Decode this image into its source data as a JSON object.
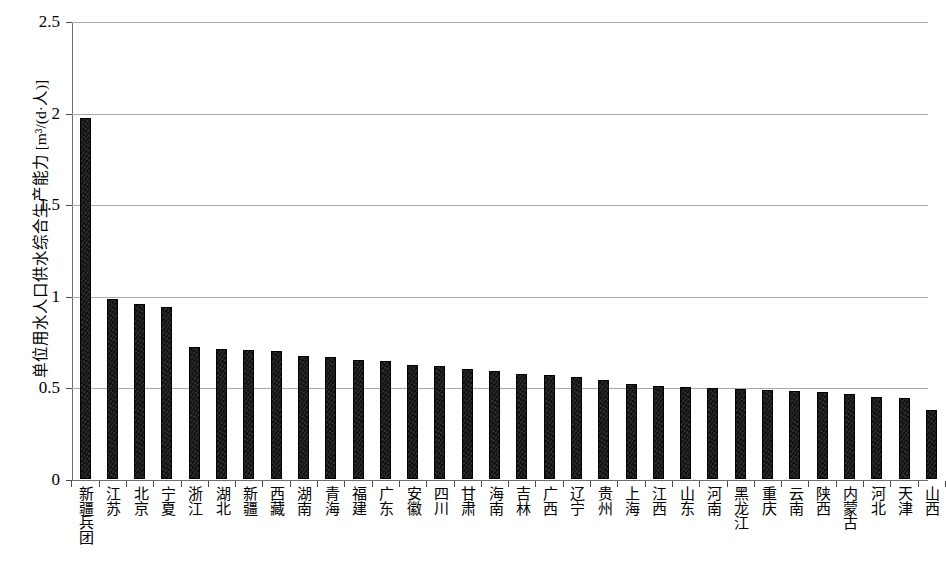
{
  "chart_data": {
    "type": "bar",
    "title": "",
    "xlabel": "",
    "ylabel": "单位用水人口供水综合生产能力 [m³/(d·人)]",
    "ylim": [
      0,
      2.5
    ],
    "ytick_labels": [
      "0",
      "0.5",
      "1",
      "1.5",
      "2",
      "2.5"
    ],
    "ytick_values": [
      0,
      0.5,
      1,
      1.5,
      2,
      2.5
    ],
    "grid": true,
    "legend": null,
    "categories": [
      "新疆兵团",
      "江苏",
      "北京",
      "宁夏",
      "浙江",
      "湖北",
      "新疆",
      "西藏",
      "湖南",
      "青海",
      "福建",
      "广东",
      "安徽",
      "四川",
      "甘肃",
      "海南",
      "吉林",
      "广西",
      "辽宁",
      "贵州",
      "上海",
      "江西",
      "山东",
      "河南",
      "黑龙江",
      "重庆",
      "云南",
      "陕西",
      "内蒙古",
      "河北",
      "天津",
      "山西"
    ],
    "values": [
      1.97,
      0.98,
      0.955,
      0.94,
      0.72,
      0.71,
      0.705,
      0.7,
      0.67,
      0.665,
      0.65,
      0.645,
      0.62,
      0.615,
      0.6,
      0.59,
      0.575,
      0.57,
      0.555,
      0.54,
      0.52,
      0.51,
      0.5,
      0.495,
      0.49,
      0.485,
      0.48,
      0.475,
      0.465,
      0.45,
      0.44,
      0.375
    ]
  },
  "colors": {
    "bar_fill": "#111111",
    "gridline": "#a9a9a9",
    "axis": "#6f6f6f",
    "text": "#000000"
  }
}
